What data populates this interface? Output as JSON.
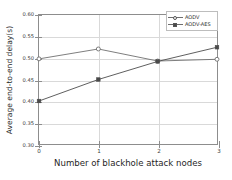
{
  "chart_data": {
    "type": "line",
    "title": "",
    "xlabel": "Number of blackhole attack nodes",
    "ylabel": "Average end-to-end delay(s)",
    "x": [
      0,
      1,
      2,
      3
    ],
    "xtick_labels": [
      "0",
      "1",
      "2",
      "3"
    ],
    "ytick_labels": [
      "0.30",
      "0.35",
      "0.40",
      "0.45",
      "0.50",
      "0.55",
      "0.60"
    ],
    "ytick_values": [
      0.3,
      0.35,
      0.4,
      0.45,
      0.5,
      0.55,
      0.6
    ],
    "xlim": [
      0,
      3
    ],
    "ylim": [
      0.3,
      0.6
    ],
    "grid": true,
    "legend_position": "top-right",
    "series": [
      {
        "name": "AODV",
        "marker": "open-circle",
        "color": "#6e6e6e",
        "values": [
          0.498,
          0.521,
          0.493,
          0.497
        ]
      },
      {
        "name": "AODV-AES",
        "marker": "filled-square",
        "color": "#4a4a4a",
        "values": [
          0.4,
          0.45,
          0.492,
          0.525
        ]
      }
    ]
  }
}
